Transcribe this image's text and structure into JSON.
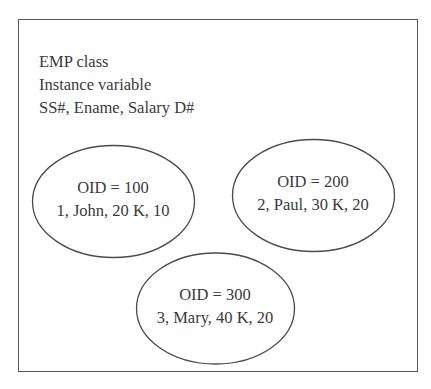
{
  "class_box": {
    "title": "EMP class",
    "subtitle": "Instance variable",
    "attributes": "SS#, Ename, Salary D#"
  },
  "instances": [
    {
      "oid_label": "OID = 100",
      "values": "1, John, 20 K, 10"
    },
    {
      "oid_label": "OID = 200",
      "values": "2, Paul, 30 K, 20"
    },
    {
      "oid_label": "OID = 300",
      "values": "3, Mary, 40 K, 20"
    }
  ],
  "colors": {
    "stroke": "#4a4a4a",
    "text": "#3a3a3a",
    "background": "#ffffff"
  }
}
